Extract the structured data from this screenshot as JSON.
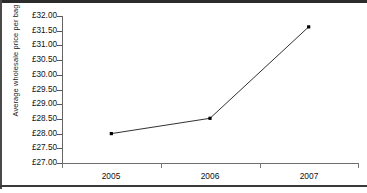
{
  "chart_data": {
    "type": "line",
    "title": "",
    "subtitle": "",
    "xlabel": "",
    "ylabel": "Average wholesale price per bag",
    "categories": [
      "2005",
      "2006",
      "2007"
    ],
    "values": [
      28.0,
      28.52,
      31.63
    ],
    "series": [
      {
        "name": "Average wholesale price per bag",
        "values": [
          28.0,
          28.52,
          31.63
        ]
      }
    ],
    "ylim": [
      27.0,
      32.0
    ],
    "ytick_step": 0.5,
    "ytick_labels": [
      "£32.00",
      "£31.50",
      "£31.00",
      "£30.50",
      "£30.00",
      "£29.50",
      "£29.00",
      "£28.50",
      "£28.00",
      "£27.50",
      "£27.00"
    ],
    "ytick_values": [
      32.0,
      31.5,
      31.0,
      30.5,
      30.0,
      29.5,
      29.0,
      28.5,
      28.0,
      27.5,
      27.0
    ],
    "currency_symbol": "£",
    "grid": false,
    "legend": false,
    "legend_position": "none",
    "marker": "square",
    "line_color": "#1a1a1a",
    "marker_color": "#000000",
    "axis_color": "#6e6e6e",
    "background_color": "#ffffff"
  },
  "axis": {
    "y_title": "Average wholesale price per bag",
    "x_labels": [
      "2005",
      "2006",
      "2007"
    ]
  }
}
